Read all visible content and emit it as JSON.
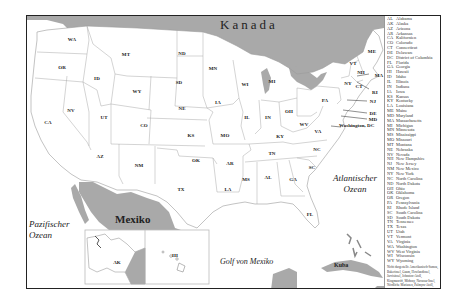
{
  "map": {
    "regions": {
      "canada": "Kanada",
      "mexico": "Mexiko",
      "pacific": [
        "Pazifischer",
        "Ozean"
      ],
      "atlantic": [
        "Atlantischer",
        "Ozean"
      ],
      "gulf": "Golf von Mexiko",
      "cuba": "Kuba",
      "dc": "Washington, DC"
    },
    "states": [
      {
        "abbr": "WA",
        "x": 45,
        "y": 23
      },
      {
        "abbr": "OR",
        "x": 35,
        "y": 51
      },
      {
        "abbr": "MT",
        "x": 99,
        "y": 38
      },
      {
        "abbr": "ID",
        "x": 70,
        "y": 62
      },
      {
        "abbr": "WY",
        "x": 110,
        "y": 75
      },
      {
        "abbr": "ND",
        "x": 155,
        "y": 37
      },
      {
        "abbr": "SD",
        "x": 152,
        "y": 66
      },
      {
        "abbr": "MN",
        "x": 186,
        "y": 52
      },
      {
        "abbr": "NE",
        "x": 155,
        "y": 92
      },
      {
        "abbr": "IA",
        "x": 191,
        "y": 86
      },
      {
        "abbr": "NV",
        "x": 44,
        "y": 94
      },
      {
        "abbr": "UT",
        "x": 77,
        "y": 101
      },
      {
        "abbr": "CA",
        "x": 21,
        "y": 106
      },
      {
        "abbr": "CO",
        "x": 117,
        "y": 109
      },
      {
        "abbr": "KS",
        "x": 164,
        "y": 119
      },
      {
        "abbr": "MO",
        "x": 198,
        "y": 119
      },
      {
        "abbr": "AZ",
        "x": 73,
        "y": 140
      },
      {
        "abbr": "NM",
        "x": 112,
        "y": 149
      },
      {
        "abbr": "OK",
        "x": 169,
        "y": 144
      },
      {
        "abbr": "TX",
        "x": 154,
        "y": 173
      },
      {
        "abbr": "AR",
        "x": 203,
        "y": 147
      },
      {
        "abbr": "LA",
        "x": 201,
        "y": 173
      },
      {
        "abbr": "WI",
        "x": 218,
        "y": 68
      },
      {
        "abbr": "MI",
        "x": 245,
        "y": 65
      },
      {
        "abbr": "IL",
        "x": 220,
        "y": 101
      },
      {
        "abbr": "IN",
        "x": 241,
        "y": 101
      },
      {
        "abbr": "OH",
        "x": 262,
        "y": 95
      },
      {
        "abbr": "KY",
        "x": 253,
        "y": 120
      },
      {
        "abbr": "WV",
        "x": 277,
        "y": 108
      },
      {
        "abbr": "VA",
        "x": 291,
        "y": 115
      },
      {
        "abbr": "TN",
        "x": 245,
        "y": 137
      },
      {
        "abbr": "NC",
        "x": 290,
        "y": 133
      },
      {
        "abbr": "SC",
        "x": 285,
        "y": 151
      },
      {
        "abbr": "MS",
        "x": 219,
        "y": 163
      },
      {
        "abbr": "AL",
        "x": 241,
        "y": 161
      },
      {
        "abbr": "GA",
        "x": 266,
        "y": 163
      },
      {
        "abbr": "FL",
        "x": 283,
        "y": 198
      },
      {
        "abbr": "PA",
        "x": 298,
        "y": 84
      },
      {
        "abbr": "NY",
        "x": 321,
        "y": 67
      },
      {
        "abbr": "VT",
        "x": 326,
        "y": 47
      },
      {
        "abbr": "NH",
        "x": 334,
        "y": 56
      },
      {
        "abbr": "ME",
        "x": 345,
        "y": 35
      },
      {
        "abbr": "MA",
        "x": 352,
        "y": 59
      },
      {
        "abbr": "CT",
        "x": 332,
        "y": 70
      },
      {
        "abbr": "RI",
        "x": 348,
        "y": 76
      },
      {
        "abbr": "NJ",
        "x": 346,
        "y": 85
      },
      {
        "abbr": "DE",
        "x": 346,
        "y": 97
      },
      {
        "abbr": "MD",
        "x": 346,
        "y": 103
      },
      {
        "abbr": "AK",
        "x": 90,
        "y": 246
      },
      {
        "abbr": "HI",
        "x": 148,
        "y": 239
      }
    ]
  },
  "legend": {
    "items": [
      {
        "abbr": "AL",
        "name": "Alabama"
      },
      {
        "abbr": "AK",
        "name": "Alaska"
      },
      {
        "abbr": "AZ",
        "name": "Arizona"
      },
      {
        "abbr": "AR",
        "name": "Arkansas"
      },
      {
        "abbr": "CA",
        "name": "Kalifornien"
      },
      {
        "abbr": "CO",
        "name": "Colorado"
      },
      {
        "abbr": "CT",
        "name": "Connecticut"
      },
      {
        "abbr": "DE",
        "name": "Delaware"
      },
      {
        "abbr": "DC",
        "name": "District of Columbia"
      },
      {
        "abbr": "FL",
        "name": "Florida"
      },
      {
        "abbr": "GA",
        "name": "Georgia"
      },
      {
        "abbr": "HI",
        "name": "Hawaii"
      },
      {
        "abbr": "ID",
        "name": "Idaho"
      },
      {
        "abbr": "IL",
        "name": "Illinois"
      },
      {
        "abbr": "IN",
        "name": "Indiana"
      },
      {
        "abbr": "IA",
        "name": "Iowa"
      },
      {
        "abbr": "KS",
        "name": "Kansas"
      },
      {
        "abbr": "KY",
        "name": "Kentucky"
      },
      {
        "abbr": "LA",
        "name": "Louisiana"
      },
      {
        "abbr": "ME",
        "name": "Maine"
      },
      {
        "abbr": "MD",
        "name": "Maryland"
      },
      {
        "abbr": "MA",
        "name": "Massachusetts"
      },
      {
        "abbr": "MI",
        "name": "Michigan"
      },
      {
        "abbr": "MN",
        "name": "Minnesota"
      },
      {
        "abbr": "MS",
        "name": "Mississippi"
      },
      {
        "abbr": "MO",
        "name": "Missouri"
      },
      {
        "abbr": "MT",
        "name": "Montana"
      },
      {
        "abbr": "NE",
        "name": "Nebraska"
      },
      {
        "abbr": "NV",
        "name": "Nevada"
      },
      {
        "abbr": "NH",
        "name": "New Hampshire"
      },
      {
        "abbr": "NJ",
        "name": "New Jersey"
      },
      {
        "abbr": "NM",
        "name": "New Mexico"
      },
      {
        "abbr": "NY",
        "name": "New York"
      },
      {
        "abbr": "NC",
        "name": "North Carolina"
      },
      {
        "abbr": "ND",
        "name": "North Dakota"
      },
      {
        "abbr": "OH",
        "name": "Ohio"
      },
      {
        "abbr": "OK",
        "name": "Oklahoma"
      },
      {
        "abbr": "OR",
        "name": "Oregon"
      },
      {
        "abbr": "PA",
        "name": "Pennsylvania"
      },
      {
        "abbr": "RI",
        "name": "Rhode Island"
      },
      {
        "abbr": "SC",
        "name": "South Carolina"
      },
      {
        "abbr": "SD",
        "name": "South Dakota"
      },
      {
        "abbr": "TN",
        "name": "Tennessee"
      },
      {
        "abbr": "TX",
        "name": "Texas"
      },
      {
        "abbr": "UT",
        "name": "Utah"
      },
      {
        "abbr": "VT",
        "name": "Vermont"
      },
      {
        "abbr": "VA",
        "name": "Virginia"
      },
      {
        "abbr": "WA",
        "name": "Washington"
      },
      {
        "abbr": "WV",
        "name": "West Virginia"
      },
      {
        "abbr": "WI",
        "name": "Wisconsin"
      },
      {
        "abbr": "WY",
        "name": "Wyoming"
      }
    ],
    "notes": [
      "Nicht dargestellt: Amerikanisch-Samoa,",
      "Bakerinsel, Guam, Howlandinsel,",
      "Jarvisinsel, Johnston-Atoll,",
      "Kingmanriff, Midway, Navassa-Insel,",
      "Nördliche Marianen, Palmyra-Atoll,",
      "Puerto Rico, Jungferninseln,",
      "Wake-Insel"
    ]
  },
  "colors": {
    "land_foreign": "#a9a9a9",
    "land_us": "#ffffff",
    "border": "#222222",
    "state_line": "#9a9a9a"
  }
}
